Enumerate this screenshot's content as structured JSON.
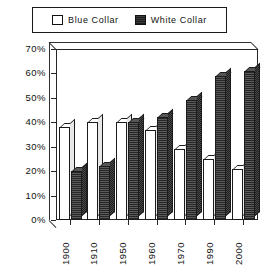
{
  "chart_data": {
    "type": "bar",
    "title": "",
    "xlabel": "",
    "ylabel": "",
    "categories": [
      "1900",
      "1910",
      "1950",
      "1960",
      "1970",
      "1990",
      "2000"
    ],
    "series": [
      {
        "name": "Blue  Collar",
        "values": [
          38,
          40,
          40,
          37,
          29,
          25,
          21
        ],
        "swatch": "empty",
        "color": "#ffffff"
      },
      {
        "name": "White  Collar",
        "values": [
          20,
          22,
          40,
          42,
          49,
          59,
          61
        ],
        "swatch": "filled",
        "color": "#474747"
      }
    ],
    "ylim": [
      0,
      70
    ],
    "ytick_values": [
      70,
      60,
      50,
      40,
      30,
      20,
      10,
      0
    ],
    "ytick_labels": [
      "70%",
      "60%",
      "50%",
      "40%",
      "30%",
      "20%",
      "10%",
      "0%"
    ],
    "grid": false,
    "legend_position": "top",
    "style": "3d-bar"
  },
  "legend": {
    "entries": [
      {
        "label": "Blue  Collar",
        "swatch": "empty"
      },
      {
        "label": "White  Collar",
        "swatch": "filled"
      }
    ]
  }
}
